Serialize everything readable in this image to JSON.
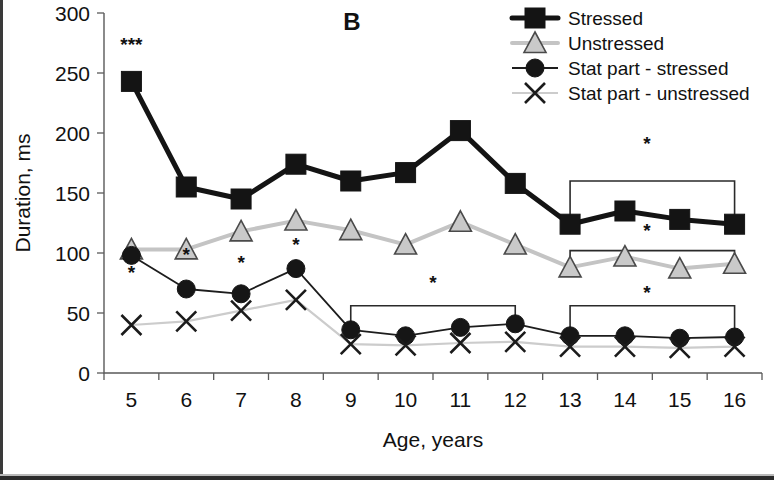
{
  "figure": {
    "panel_label": "B"
  },
  "chart_data": {
    "type": "line",
    "title": "B",
    "xlabel": "Age, years",
    "ylabel": "Duration, ms",
    "x": [
      5,
      6,
      7,
      8,
      9,
      10,
      11,
      12,
      13,
      14,
      15,
      16
    ],
    "xticklabels": [
      "5",
      "6",
      "7",
      "8",
      "9",
      "10",
      "11",
      "12",
      "13",
      "14",
      "15",
      "16"
    ],
    "yticklabels": [
      "0",
      "50",
      "100",
      "150",
      "200",
      "250",
      "300"
    ],
    "yticks": [
      0,
      50,
      100,
      150,
      200,
      250,
      300
    ],
    "xlim": [
      4.5,
      16.5
    ],
    "ylim": [
      0,
      300
    ],
    "grid": false,
    "legend_position": "top-right",
    "series": [
      {
        "name": "Stressed",
        "marker": "square",
        "color": "#141414",
        "line_color": "#141414",
        "values": [
          243,
          155,
          145,
          174,
          160,
          167,
          202,
          158,
          124,
          135,
          128,
          124
        ]
      },
      {
        "name": "Unstressed",
        "marker": "triangle",
        "color": "#c9c9c9",
        "line_color": "#c4c4c4",
        "values": [
          103,
          103,
          118,
          127,
          119,
          107,
          126,
          107,
          88,
          97,
          87,
          91
        ]
      },
      {
        "name": "Stat part - stressed",
        "marker": "circle",
        "color": "#161616",
        "line_color": "#1d1d1d",
        "values": [
          98,
          70,
          66,
          87,
          36,
          31,
          38,
          41,
          31,
          31,
          29,
          30
        ]
      },
      {
        "name": "Stat part - unstressed",
        "marker": "x",
        "color": "#1b1b1b",
        "line_color": "#cccccc",
        "values": [
          40,
          43,
          52,
          61,
          24,
          23,
          25,
          26,
          22,
          22,
          21,
          22
        ]
      }
    ],
    "annotations": [
      {
        "id": "sig-age5-stressed",
        "text": "***",
        "x": 5,
        "y": 268
      },
      {
        "id": "sig-age5-statpart",
        "text": "*",
        "x": 5,
        "y": 78
      },
      {
        "id": "sig-age6-unstressed",
        "text": "*",
        "x": 6,
        "y": 93
      },
      {
        "id": "sig-age7-unstressed",
        "text": "*",
        "x": 7,
        "y": 87
      },
      {
        "id": "sig-age8-unstressed",
        "text": "*",
        "x": 8,
        "y": 102
      },
      {
        "id": "sig-bracket-mid-statpart",
        "text": "*",
        "x": 10.5,
        "y": 70
      },
      {
        "id": "sig-bracket-right-stressed",
        "text": "*",
        "x": 14.4,
        "y": 186
      },
      {
        "id": "sig-bracket-right-unstressed",
        "text": "*",
        "x": 14.4,
        "y": 113
      },
      {
        "id": "sig-bracket-right-statpart",
        "text": "*",
        "x": 14.4,
        "y": 62
      }
    ],
    "brackets": [
      {
        "id": "bracket-stressed-13-16",
        "x_start": 13,
        "x_end": 16,
        "y": 160,
        "depth": 30,
        "series": "Stressed"
      },
      {
        "id": "bracket-unstressed-13-16",
        "x_start": 13,
        "x_end": 16,
        "y": 102,
        "depth": 18,
        "series": "Unstressed"
      },
      {
        "id": "bracket-statpart-9-12",
        "x_start": 9,
        "x_end": 12,
        "y": 56,
        "depth": 20,
        "series": "Stat part - stressed"
      },
      {
        "id": "bracket-statpart-13-16",
        "x_start": 13,
        "x_end": 16,
        "y": 56,
        "depth": 20,
        "series": "Stat part - stressed"
      }
    ]
  },
  "legend": {
    "items": [
      {
        "label": "Stressed",
        "marker": "square"
      },
      {
        "label": "Unstressed",
        "marker": "triangle"
      },
      {
        "label": "Stat part - stressed",
        "marker": "circle"
      },
      {
        "label": "Stat part - unstressed",
        "marker": "x"
      }
    ]
  }
}
